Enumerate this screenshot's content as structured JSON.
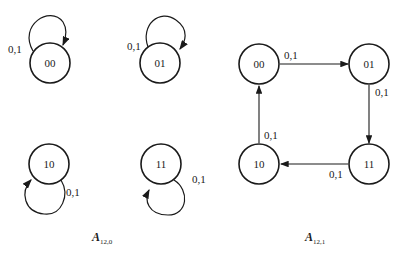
{
  "diagrams": [
    {
      "caption": {
        "main": "A",
        "sub": "12,0"
      },
      "nodes": [
        {
          "id": "00",
          "label": "00",
          "self_loop_label": "0,1"
        },
        {
          "id": "01",
          "label": "01",
          "self_loop_label": "0,1"
        },
        {
          "id": "10",
          "label": "10",
          "self_loop_label": "0,1"
        },
        {
          "id": "11",
          "label": "11",
          "self_loop_label": "0,1"
        }
      ]
    },
    {
      "caption": {
        "main": "A",
        "sub": "12,1"
      },
      "nodes": [
        {
          "id": "00",
          "label": "00"
        },
        {
          "id": "01",
          "label": "01"
        },
        {
          "id": "10",
          "label": "10"
        },
        {
          "id": "11",
          "label": "11"
        }
      ],
      "edges": [
        {
          "from": "00",
          "to": "01",
          "label": "0,1"
        },
        {
          "from": "01",
          "to": "11",
          "label": "0,1"
        },
        {
          "from": "11",
          "to": "10",
          "label": "0,1"
        },
        {
          "from": "10",
          "to": "00",
          "label": "0,1"
        }
      ]
    }
  ]
}
